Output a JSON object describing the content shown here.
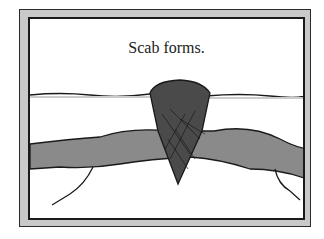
{
  "caption": "Scab forms.",
  "illustration": {
    "subject": "scab-over-wound",
    "elements": [
      "skin-surface-line",
      "scab",
      "blood-vessel",
      "clot-fibers"
    ],
    "colors": {
      "frame_band": "#c9c9c9",
      "scab": "#4a4a4a",
      "vessel": "#8a8a8a",
      "ink": "#1a1a1a"
    }
  }
}
